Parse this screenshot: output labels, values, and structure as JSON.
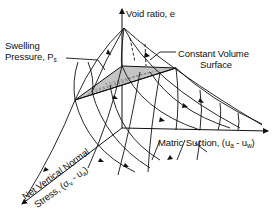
{
  "figure": {
    "type": "3D constitutive surface sketch",
    "background": "#ffffff",
    "line_color": "#111111",
    "shade_color": "#bdbdbd"
  },
  "axes": {
    "vertical": {
      "label": "Void ratio, e"
    },
    "right": {
      "label_main": "Matric Suction, (u",
      "sub_a": "a",
      "mid": " - u",
      "sub_w": "w",
      "close": ")"
    },
    "oblique": {
      "label_line1": "Net Vertical Normal",
      "label_line2_main": "Stress, (σ",
      "sub_v": "v",
      "mid": " - u",
      "sub_a": "a",
      "close": ")"
    }
  },
  "annotations": {
    "swelling_line1": "Swelling",
    "swelling_line2_main": "Pressure, P",
    "swelling_sub": "s",
    "constant_line1": "Constant Volume",
    "constant_line2": "Surface"
  }
}
